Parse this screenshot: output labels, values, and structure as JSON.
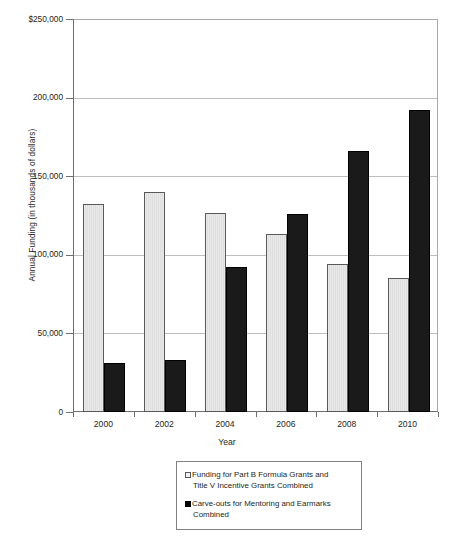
{
  "chart_data": {
    "type": "bar",
    "title": "",
    "xlabel": "Year",
    "ylabel": "Annual Funding (in thousands of dollars)",
    "categories": [
      "2000",
      "2002",
      "2004",
      "2006",
      "2008",
      "2010"
    ],
    "series": [
      {
        "name": "Funding for Part B Formula Grants and Title V Incentive Grants Combined",
        "legend_line1": "Funding for Part B Formula Grants and",
        "legend_line2": "Title V Incentive Grants Combined",
        "color": "#e9e9e9",
        "border_color": "#58595b",
        "swatch": "open-square-swatch",
        "values": [
          132000,
          140000,
          126500,
          113000,
          94000,
          85000
        ]
      },
      {
        "name": "Carve-outs for Mentoring and Earmarks Combined",
        "legend_line1": "Carve-outs for Mentoring and Earmarks",
        "legend_line2": "Combined",
        "color": "#1a1a1a",
        "border_color": "#000000",
        "swatch": "filled-square-swatch",
        "values": [
          31000,
          33000,
          92000,
          126000,
          166000,
          192000
        ]
      }
    ],
    "ylim": [
      0,
      250000
    ],
    "yticks": [
      0,
      50000,
      100000,
      150000,
      200000,
      250000
    ],
    "ytick_labels": [
      "0",
      "50,000",
      "100,000",
      "150,000",
      "200,000",
      "$250,000"
    ],
    "grid": true,
    "grid_axis": "y",
    "legend_position": "bottom-center"
  },
  "axes": {
    "y_title": "Annual Funding (in thousands of dollars)",
    "x_title": "Year"
  }
}
